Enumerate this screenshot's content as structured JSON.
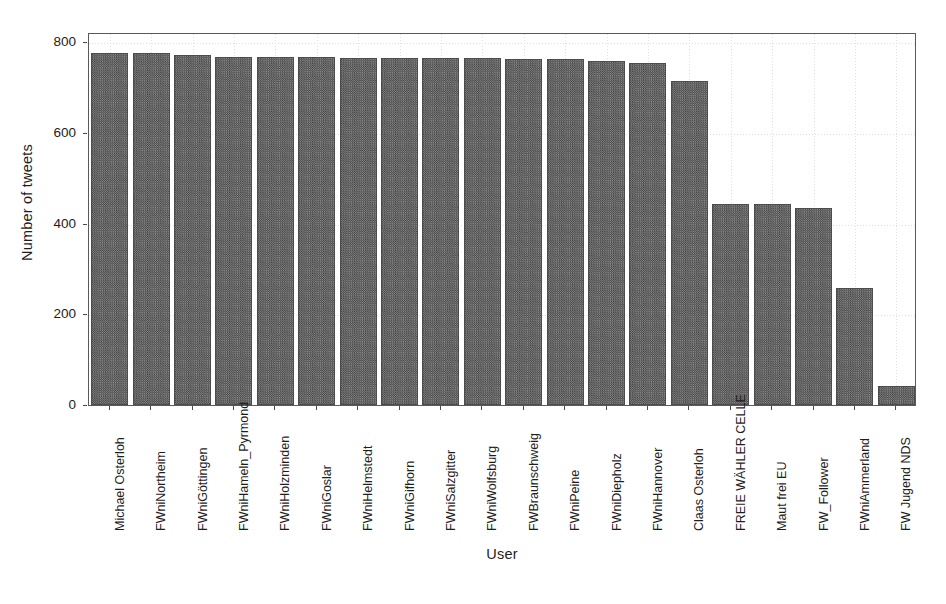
{
  "chart_data": {
    "type": "bar",
    "title": "",
    "xlabel": "User",
    "ylabel": "Number of tweets",
    "ylim": [
      0,
      800
    ],
    "yticks": [
      0,
      200,
      400,
      600,
      800
    ],
    "ytick_labels": [
      "0",
      "200",
      "400",
      "600",
      "800"
    ],
    "grid": true,
    "legend": "none",
    "orientation": "vertical",
    "bar_color": "#565656",
    "bar_fill_pattern": "checkerboard-dither",
    "categories": [
      "Michael Osterloh",
      "FWniNortheim",
      "FWniGöttingen",
      "FWniHameln_Pyrmond",
      "FWniHolzminden",
      "FWniGoslar",
      "FWniHelmstedt",
      "FWniGifhorn",
      "FWniSalzgitter",
      "FWniWolfsburg",
      "FWBraunschweig",
      "FWniPeine",
      "FWniDiepholz",
      "FWniHannover",
      "Claas Osterloh",
      "FREIE WÄHLER CELLE",
      "Maut frei EU",
      "FW_Follower",
      "FWniAmmerland",
      "FW Jugend NDS"
    ],
    "values": [
      776,
      775,
      771,
      766,
      766,
      766,
      765,
      765,
      764,
      764,
      763,
      762,
      758,
      754,
      714,
      443,
      442,
      435,
      258,
      42
    ]
  }
}
